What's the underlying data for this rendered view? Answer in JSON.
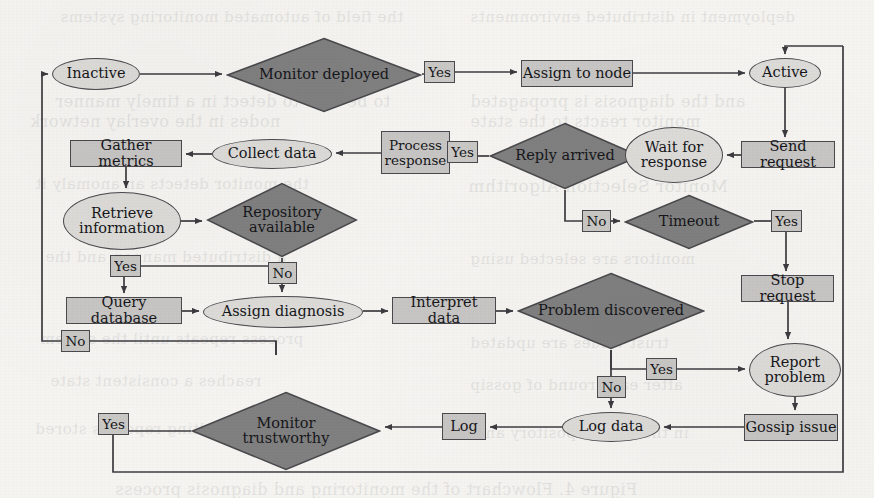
{
  "diagram": {
    "colors": {
      "page_background": "#f5f4f1",
      "decision_fill": "#808080",
      "process_fill": "#c7c6c4",
      "state_fill": "#dcdbd8",
      "edge_label_fill": "#c9c8c5",
      "stroke": "#4a4a4e",
      "text": "#17171b"
    },
    "nodes": {
      "inactive": {
        "label": "Inactive",
        "shape": "ellipse",
        "x": 52,
        "y": 58,
        "w": 88,
        "h": 32
      },
      "monitor_deployed": {
        "label": "Monitor deployed",
        "shape": "diamond",
        "x": 226,
        "y": 37,
        "w": 196,
        "h": 76
      },
      "assign_to_node": {
        "label": "Assign to node",
        "shape": "rect",
        "x": 521,
        "y": 60,
        "w": 112,
        "h": 27
      },
      "active": {
        "label": "Active",
        "shape": "ellipse",
        "x": 749,
        "y": 58,
        "w": 72,
        "h": 30
      },
      "send_request": {
        "label": "Send request",
        "shape": "rect",
        "x": 741,
        "y": 141,
        "w": 94,
        "h": 27
      },
      "wait_for_response": {
        "label": "Wait for\nresponse",
        "shape": "ellipse",
        "x": 625,
        "y": 127,
        "w": 98,
        "h": 56
      },
      "reply_arrived": {
        "label": "Reply arrived",
        "shape": "diamond",
        "x": 489,
        "y": 122,
        "w": 152,
        "h": 68
      },
      "process_response": {
        "label": "Process\nresponse",
        "shape": "rect",
        "x": 381,
        "y": 131,
        "w": 69,
        "h": 43
      },
      "collect_data": {
        "label": "Collect data",
        "shape": "ellipse",
        "x": 212,
        "y": 139,
        "w": 120,
        "h": 30
      },
      "gather_metrics": {
        "label": "Gather metrics",
        "shape": "rect",
        "x": 70,
        "y": 140,
        "w": 112,
        "h": 27
      },
      "retrieve_information": {
        "label": "Retrieve\ninformation",
        "shape": "ellipse",
        "x": 63,
        "y": 192,
        "w": 118,
        "h": 58
      },
      "repository_available": {
        "label": "Repository\navailable",
        "shape": "diamond",
        "x": 206,
        "y": 182,
        "w": 152,
        "h": 76
      },
      "timeout": {
        "label": "Timeout",
        "shape": "diamond",
        "x": 624,
        "y": 194,
        "w": 130,
        "h": 56
      },
      "stop_request": {
        "label": "Stop request",
        "shape": "rect",
        "x": 741,
        "y": 275,
        "w": 93,
        "h": 27
      },
      "query_database": {
        "label": "Query database",
        "shape": "rect",
        "x": 66,
        "y": 297,
        "w": 116,
        "h": 27
      },
      "assign_diagnosis": {
        "label": "Assign diagnosis",
        "shape": "ellipse",
        "x": 203,
        "y": 296,
        "w": 160,
        "h": 32
      },
      "interpret_data": {
        "label": "Interpret data",
        "shape": "rect",
        "x": 392,
        "y": 297,
        "w": 104,
        "h": 27
      },
      "problem_discovered": {
        "label": "Problem discovered",
        "shape": "diamond",
        "x": 517,
        "y": 272,
        "w": 188,
        "h": 78
      },
      "report_problem": {
        "label": "Report\nproblem",
        "shape": "ellipse",
        "x": 749,
        "y": 343,
        "w": 92,
        "h": 54
      },
      "gossip_issue": {
        "label": "Gossip issue",
        "shape": "rect",
        "x": 744,
        "y": 414,
        "w": 94,
        "h": 27
      },
      "log_data": {
        "label": "Log data",
        "shape": "ellipse",
        "x": 562,
        "y": 412,
        "w": 98,
        "h": 30
      },
      "log": {
        "label": "Log",
        "shape": "rect",
        "x": 442,
        "y": 413,
        "w": 44,
        "h": 27
      },
      "monitor_trustworthy": {
        "label": "Monitor\ntrustworthy",
        "shape": "diamond",
        "x": 191,
        "y": 391,
        "w": 190,
        "h": 80
      }
    },
    "edge_labels": [
      {
        "id": "yes_monitor_deployed",
        "text": "Yes",
        "x": 424,
        "y": 61,
        "w": 31,
        "h": 22
      },
      {
        "id": "yes_reply_arrived",
        "text": "Yes",
        "x": 447,
        "y": 141,
        "w": 31,
        "h": 22
      },
      {
        "id": "no_reply_arrived",
        "text": "No",
        "x": 582,
        "y": 210,
        "w": 29,
        "h": 22
      },
      {
        "id": "yes_timeout",
        "text": "Yes",
        "x": 771,
        "y": 210,
        "w": 31,
        "h": 22
      },
      {
        "id": "yes_repository",
        "text": "Yes",
        "x": 110,
        "y": 255,
        "w": 31,
        "h": 22
      },
      {
        "id": "no_repository",
        "text": "No",
        "x": 268,
        "y": 262,
        "w": 29,
        "h": 22
      },
      {
        "id": "no_query_database",
        "text": "No",
        "x": 61,
        "y": 330,
        "w": 29,
        "h": 22
      },
      {
        "id": "yes_problem_discovered",
        "text": "Yes",
        "x": 646,
        "y": 358,
        "w": 31,
        "h": 22
      },
      {
        "id": "no_problem_discovered",
        "text": "No",
        "x": 597,
        "y": 376,
        "w": 29,
        "h": 22
      },
      {
        "id": "yes_monitor_trust",
        "text": "Yes",
        "x": 98,
        "y": 413,
        "w": 31,
        "h": 22
      }
    ],
    "bleed_text": [
      {
        "t": "the field of automated monitoring systems",
        "x": 60,
        "y": 8,
        "s": 15
      },
      {
        "t": "deployment in distributed environments",
        "x": 470,
        "y": 8,
        "s": 15
      },
      {
        "t": "to be able to detect in a timely manner",
        "x": 55,
        "y": 92,
        "s": 16
      },
      {
        "t": "and the diagnosis is propagated",
        "x": 470,
        "y": 92,
        "s": 16
      },
      {
        "t": "nodes in the overlay network",
        "x": 30,
        "y": 112,
        "s": 16
      },
      {
        "t": "monitor reacts to the state",
        "x": 470,
        "y": 112,
        "s": 16
      },
      {
        "t": "the monitor detects an anomaly it",
        "x": 35,
        "y": 175,
        "s": 15
      },
      {
        "t": "Monitor Selection Algorithm",
        "x": 468,
        "y": 176,
        "s": 17
      },
      {
        "t": "a distributed manner, and the",
        "x": 45,
        "y": 248,
        "s": 15
      },
      {
        "t": "monitors are selected using",
        "x": 470,
        "y": 250,
        "s": 15
      },
      {
        "t": "process repeats until the system",
        "x": 40,
        "y": 330,
        "s": 15
      },
      {
        "t": "trust values are updated",
        "x": 470,
        "y": 334,
        "s": 15
      },
      {
        "t": "reaches a consistent state",
        "x": 50,
        "y": 372,
        "s": 15
      },
      {
        "t": "after each round of gossip",
        "x": 470,
        "y": 376,
        "s": 15
      },
      {
        "t": "the resulting report is stored",
        "x": 35,
        "y": 420,
        "s": 15
      },
      {
        "t": "in the local repository and",
        "x": 475,
        "y": 424,
        "s": 15
      },
      {
        "t": "Figure 4. Flowchart of the monitoring and diagnosis process",
        "x": 115,
        "y": 480,
        "s": 16
      }
    ]
  }
}
